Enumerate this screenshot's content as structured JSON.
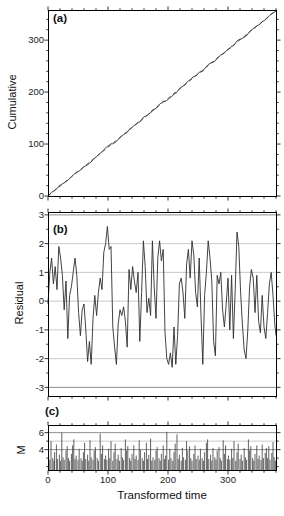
{
  "figure": {
    "bg": "#ffffff",
    "frame_color": "#000000",
    "line_color": "#2e2e2e",
    "dashed_color": "#3a3a3a",
    "grid_light": "#bdbdbd",
    "grid_strong": "#8f8f8f",
    "tick_color": "#000000",
    "text_color": "#1b1b1b"
  },
  "panels": {
    "a": {
      "label": "(a)",
      "ylabel": "Cumulative",
      "ytick_labels": [
        "0",
        "100",
        "200",
        "300"
      ]
    },
    "b": {
      "label": "(b)",
      "ylabel": "Residual",
      "ytick_labels": [
        "-3",
        "-2",
        "-1",
        "0",
        "1",
        "2",
        "3"
      ]
    },
    "c": {
      "label": "(c)",
      "ylabel": "M",
      "xlabel": "Transformed time",
      "ytick_labels": [
        "4",
        "6"
      ],
      "xtick_labels": [
        "0",
        "100",
        "200",
        "300"
      ]
    }
  },
  "chart_data": [
    {
      "type": "line",
      "panel": "a",
      "title": "(a)",
      "ylabel": "Cumulative",
      "xlim": [
        0,
        380
      ],
      "ylim": [
        0,
        358
      ],
      "yticks": [
        0,
        100,
        200,
        300
      ],
      "xticks": [
        0,
        100,
        200,
        300
      ],
      "minor_step_x": 20,
      "minor_step_y": 20,
      "grid": "off",
      "trend_slope": 0.9395,
      "series": [
        {
          "name": "observed-cumulative",
          "style": "solid",
          "derivation": "trend_slope * t + residual(t) using panel-b residual series"
        },
        {
          "name": "expected-trend",
          "style": "dashed",
          "x": [
            0,
            380
          ],
          "y": [
            0,
            357
          ]
        }
      ]
    },
    {
      "type": "line",
      "panel": "b",
      "title": "(b)",
      "ylabel": "Residual",
      "xlim": [
        0,
        380
      ],
      "ylim": [
        -3.3,
        3.1
      ],
      "yticks": [
        -3,
        -2,
        -1,
        0,
        1,
        2,
        3
      ],
      "yminor": [
        -2.5,
        -1.5,
        -0.5,
        0.5,
        1.5,
        2.5
      ],
      "gridlines": [
        -3,
        -2,
        -1,
        0,
        1,
        2,
        3
      ],
      "xticks": [
        0,
        100,
        200,
        300
      ],
      "minor_step_x": 20,
      "t_start": 0,
      "t_step": 3,
      "values": [
        -0.1,
        1.0,
        1.5,
        0.6,
        1.2,
        0.4,
        1.9,
        1.5,
        0.9,
        -0.3,
        0.7,
        -1.3,
        0.2,
        0.5,
        1.0,
        1.5,
        0.9,
        -0.4,
        -1.2,
        -0.3,
        -0.1,
        -1.0,
        -2.1,
        -1.4,
        -2.2,
        -0.6,
        0.2,
        -0.5,
        0.3,
        0.8,
        0.4,
        1.7,
        2.0,
        2.6,
        1.8,
        1.9,
        -0.9,
        -1.6,
        -2.2,
        -0.8,
        -0.3,
        -0.5,
        -0.2,
        -0.7,
        -1.6,
        1.1,
        0.4,
        1.2,
        0.7,
        0.3,
        1.0,
        -1.4,
        0.3,
        2.1,
        1.2,
        -0.4,
        0.1,
        -0.5,
        2.1,
        0.5,
        -0.6,
        1.5,
        2.1,
        1.4,
        1.8,
        -1.1,
        -2.0,
        -2.2,
        -1.8,
        -2.3,
        -0.9,
        -2.2,
        -1.2,
        0.6,
        0.8,
        0.3,
        -0.6,
        1.3,
        1.8,
        0.8,
        2.1,
        1.6,
        0.3,
        -0.2,
        1.5,
        -0.5,
        -2.2,
        0.2,
        1.0,
        2.1,
        1.5,
        0.7,
        -1.4,
        -1.9,
        0.9,
        0.6,
        1.0,
        -0.3,
        -0.9,
        -0.1,
        0.8,
        -1.0,
        0.9,
        -1.3,
        0.4,
        2.4,
        1.9,
        0.3,
        -0.8,
        -1.7,
        -2.0,
        -1.0,
        0.5,
        1.1,
        0.8,
        -0.4,
        0.9,
        -0.7,
        -1.1,
        0.2,
        -0.9,
        -1.3,
        -0.4,
        0.6,
        1.0,
        0.2,
        -0.8,
        -1.2
      ]
    },
    {
      "type": "bar",
      "panel": "c",
      "title": "(c)",
      "ylabel": "M",
      "xlabel": "Transformed time",
      "xlim": [
        0,
        380
      ],
      "ylim": [
        1.6,
        6.9
      ],
      "yticks": [
        4,
        6
      ],
      "yminor": [
        2,
        3,
        5
      ],
      "gridlines": [
        4,
        5,
        6
      ],
      "xticks": [
        0,
        100,
        200,
        300
      ],
      "minor_step_x": 20,
      "baseline": 1.6,
      "x": [
        1,
        3,
        5,
        8,
        10,
        11,
        14,
        16,
        19,
        21,
        23,
        25,
        27,
        30,
        32,
        34,
        36,
        39,
        41,
        43,
        45,
        47,
        50,
        52,
        55,
        57,
        59,
        61,
        63,
        66,
        68,
        70,
        72,
        75,
        77,
        79,
        82,
        84,
        87,
        89,
        91,
        94,
        96,
        98,
        101,
        103,
        105,
        108,
        110,
        112,
        115,
        117,
        119,
        122,
        124,
        126,
        129,
        131,
        133,
        136,
        138,
        140,
        143,
        145,
        147,
        150,
        152,
        154,
        157,
        159,
        161,
        164,
        166,
        168,
        171,
        173,
        175,
        178,
        180,
        182,
        185,
        187,
        189,
        192,
        194,
        196,
        198,
        201,
        203,
        205,
        208,
        210,
        212,
        215,
        217,
        219,
        222,
        224,
        226,
        229,
        231,
        233,
        236,
        238,
        240,
        243,
        245,
        247,
        250,
        252,
        254,
        257,
        259,
        261,
        264,
        266,
        268,
        271,
        273,
        275,
        278,
        280,
        282,
        285,
        287,
        289,
        292,
        294,
        296,
        299,
        301,
        303,
        306,
        308,
        310,
        313,
        315,
        317,
        320,
        322,
        324,
        327,
        329,
        331,
        334,
        336,
        338,
        341,
        343,
        345,
        348,
        350,
        352,
        355,
        357,
        359,
        362,
        364,
        366,
        368,
        370,
        373,
        375,
        377,
        379
      ],
      "m": [
        3.4,
        2.8,
        5.0,
        3.0,
        2.7,
        3.7,
        4.6,
        2.9,
        3.4,
        2.7,
        6.0,
        3.1,
        2.8,
        3.9,
        4.4,
        3.0,
        2.7,
        3.5,
        4.5,
        5.2,
        2.9,
        3.3,
        2.8,
        4.1,
        3.0,
        2.7,
        3.7,
        4.8,
        2.9,
        3.4,
        2.7,
        5.1,
        3.1,
        2.8,
        3.9,
        4.3,
        3.0,
        2.7,
        5.9,
        3.5,
        4.5,
        2.9,
        3.3,
        2.8,
        4.1,
        3.0,
        5.0,
        2.7,
        3.7,
        4.7,
        2.9,
        3.4,
        2.7,
        4.2,
        3.1,
        2.8,
        5.2,
        3.9,
        4.4,
        3.0,
        2.7,
        3.5,
        4.5,
        2.9,
        3.3,
        2.8,
        5.1,
        4.0,
        3.0,
        2.7,
        3.7,
        4.8,
        2.9,
        3.4,
        5.3,
        2.7,
        3.1,
        2.8,
        3.9,
        4.3,
        3.0,
        2.7,
        3.5,
        4.5,
        2.9,
        3.3,
        6.1,
        2.8,
        4.1,
        3.0,
        2.7,
        3.7,
        4.7,
        5.8,
        2.9,
        3.4,
        2.7,
        4.2,
        3.1,
        2.8,
        5.0,
        3.9,
        4.4,
        3.0,
        2.7,
        3.5,
        4.5,
        2.9,
        3.3,
        2.8,
        4.1,
        3.0,
        2.7,
        3.7,
        4.8,
        5.2,
        2.9,
        3.4,
        2.7,
        4.2,
        3.1,
        2.8,
        3.9,
        4.3,
        3.0,
        2.7,
        5.1,
        3.5,
        4.5,
        2.9,
        3.3,
        2.8,
        4.1,
        3.0,
        5.0,
        2.7,
        3.7,
        4.7,
        2.9,
        3.4,
        2.7,
        4.2,
        3.1,
        2.8,
        5.2,
        3.9,
        4.4,
        3.0,
        2.7,
        3.5,
        4.5,
        2.9,
        3.3,
        2.8,
        4.6,
        3.0,
        3.6,
        4.2,
        3.0,
        4.4,
        2.8,
        3.6,
        4.9,
        3.1,
        2.7
      ]
    }
  ]
}
